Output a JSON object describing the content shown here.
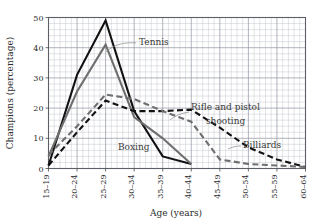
{
  "chart_data": {
    "type": "line",
    "title": "",
    "xlabel": "Age (years)",
    "ylabel": "Champions (percentage)",
    "categories": [
      "15–19",
      "20–24",
      "25–29",
      "30–34",
      "35–39",
      "40–44",
      "45–49",
      "50–54",
      "55–59",
      "60–64"
    ],
    "ylim": [
      0,
      50
    ],
    "yticks": [
      0,
      10,
      20,
      30,
      40,
      50
    ],
    "ytick_labels": [
      "0",
      "10",
      "20",
      "30",
      "40",
      "50"
    ],
    "grid": true,
    "grid_minor": true,
    "legend": "inline-annotations",
    "series": [
      {
        "name": "Boxing",
        "color": "#111111",
        "style": "solid",
        "width": 2.1,
        "values": [
          1,
          31,
          49,
          19,
          4,
          1.5,
          null,
          null,
          null,
          null
        ]
      },
      {
        "name": "Tennis",
        "color": "#6e6e6e",
        "style": "solid",
        "width": 2.1,
        "values": [
          4,
          25.5,
          41,
          17,
          10,
          1.5,
          null,
          null,
          null,
          null
        ]
      },
      {
        "name": "Billiards",
        "color": "#111111",
        "style": "dashed",
        "width": 2.1,
        "values": [
          1,
          12,
          22.5,
          19,
          19,
          19.5,
          13.5,
          7,
          3,
          0.5
        ]
      },
      {
        "name": "Rifle and pistol shooting",
        "color": "#6e6e6e",
        "style": "dashed",
        "width": 2.1,
        "values": [
          4.5,
          14,
          24.5,
          23,
          19,
          15.5,
          3,
          1.5,
          1,
          0.5
        ]
      }
    ],
    "annotations": [
      {
        "text": "Tennis",
        "x": 139,
        "y": 45
      },
      {
        "text": "Boxing",
        "x": 118,
        "y": 150
      },
      {
        "text": "Rifle and pistol",
        "x": 191,
        "y": 110
      },
      {
        "text": "shooting",
        "x": 206,
        "y": 124
      },
      {
        "text": "Billiards",
        "x": 243,
        "y": 148
      }
    ]
  }
}
